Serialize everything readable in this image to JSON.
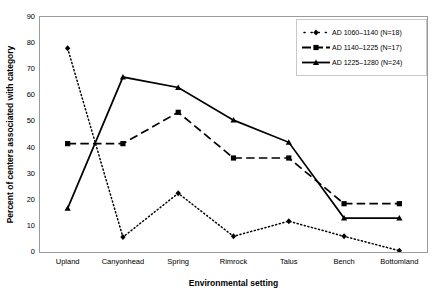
{
  "chart_data": {
    "type": "line",
    "title": "",
    "subtitle": "",
    "xlabel": "Environmental setting",
    "ylabel": "Percent of centers associated with category",
    "categories": [
      "Upland",
      "Canyonhead",
      "Spring",
      "Rimrock",
      "Talus",
      "Bench",
      "Bottomland"
    ],
    "ylim": [
      0,
      90
    ],
    "yticks": [
      0,
      10,
      20,
      30,
      40,
      50,
      60,
      70,
      80,
      90
    ],
    "ytick_labels": [
      "0",
      "10",
      "20",
      "30",
      "40",
      "50",
      "60",
      "70",
      "80",
      "90"
    ],
    "grid": false,
    "legend_position": "top-right",
    "series": [
      {
        "name": "AD  1060–1140 (N=18)",
        "marker": "diamond",
        "line_style": "dotted",
        "color": "#000000",
        "values": [
          78.0,
          5.7,
          22.5,
          6.0,
          11.8,
          6.0,
          0.5
        ]
      },
      {
        "name": "AD  1140–1225 (N=17)",
        "marker": "square",
        "line_style": "dashed",
        "color": "#000000",
        "values": [
          41.5,
          41.5,
          53.5,
          36.0,
          36.0,
          18.5,
          18.5
        ]
      },
      {
        "name": "AD  1225–1280 (N=24)",
        "marker": "triangle",
        "line_style": "solid",
        "color": "#000000",
        "values": [
          16.7,
          67.0,
          63.0,
          50.5,
          42.0,
          13.0,
          13.0
        ]
      }
    ]
  },
  "axes": {
    "x_title": "Environmental setting",
    "y_title": "Percent of centers associated with category"
  },
  "legend": {
    "items": [
      {
        "label": "AD  1060–1140 (N=18)",
        "marker": "diamond",
        "line_style": "dotted"
      },
      {
        "label": "AD  1140–1225 (N=17)",
        "marker": "square",
        "line_style": "dashed"
      },
      {
        "label": "AD  1225–1280 (N=24)",
        "marker": "triangle",
        "line_style": "solid"
      }
    ]
  },
  "colors": {
    "ink": "#000000",
    "frame": "#9b9b9b",
    "legend_border": "#c8c8c8",
    "background": "#ffffff"
  }
}
